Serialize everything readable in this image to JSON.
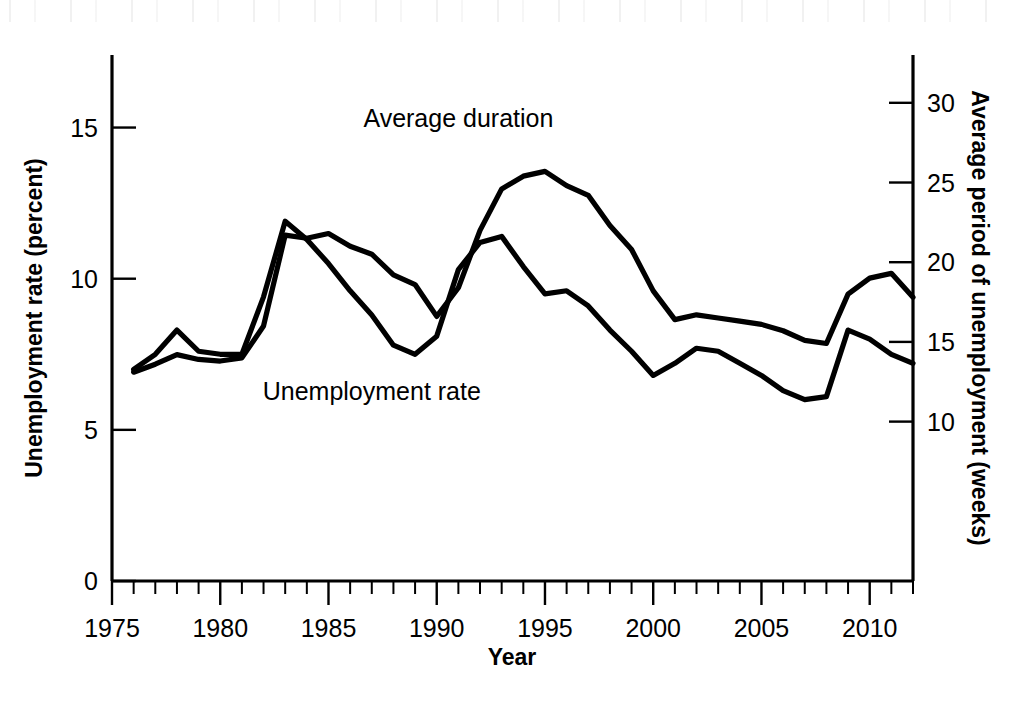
{
  "figure": {
    "background_color": "#ffffff",
    "line_color": "#000000"
  },
  "chart_data": {
    "type": "line",
    "title": "",
    "xlabel": "Year",
    "ylabel": "Unemployment rate (percent)",
    "y2label": "Average period of unemployment (weeks)",
    "xlim": [
      1975,
      2012
    ],
    "ylim": [
      0,
      17.4
    ],
    "y2lim": [
      0,
      33.0
    ],
    "grid": false,
    "legend": "inline-annotations",
    "x_ticks_major": [
      1975,
      1980,
      1985,
      1990,
      1995,
      2000,
      2005,
      2010
    ],
    "x_tick_labels": [
      "1975",
      "1980",
      "1985",
      "1990",
      "1995",
      "2000",
      "2005",
      "2010"
    ],
    "x_ticks_minor_step": 1,
    "y_ticks": [
      0,
      5,
      10,
      15
    ],
    "y_tick_labels": [
      "0",
      "5",
      "10",
      "15"
    ],
    "y2_ticks": [
      10,
      15,
      20,
      25,
      30
    ],
    "y2_tick_labels": [
      "10",
      "15",
      "20",
      "25",
      "30"
    ],
    "x": [
      1976,
      1977,
      1978,
      1979,
      1980,
      1981,
      1982,
      1983,
      1984,
      1985,
      1986,
      1987,
      1988,
      1989,
      1990,
      1991,
      1992,
      1993,
      1994,
      1995,
      1996,
      1997,
      1998,
      1999,
      2000,
      2001,
      2002,
      2003,
      2004,
      2005,
      2006,
      2007,
      2008,
      2009,
      2010,
      2011,
      2012
    ],
    "series": [
      {
        "name": "Average duration",
        "axis": "right",
        "units": "weeks",
        "label_x": 1991,
        "label_y": 28.5,
        "values": [
          13.1,
          13.6,
          14.2,
          13.9,
          13.8,
          14.0,
          16.0,
          21.7,
          21.5,
          21.8,
          21.0,
          20.5,
          19.2,
          18.6,
          16.6,
          18.4,
          22.0,
          24.6,
          25.4,
          25.7,
          24.8,
          24.2,
          22.3,
          20.8,
          18.2,
          16.4,
          16.7,
          16.5,
          16.3,
          16.1,
          15.7,
          15.1,
          14.9,
          18.0,
          19.0,
          19.3,
          17.8
        ]
      },
      {
        "name": "Unemployment rate",
        "axis": "left",
        "units": "percent",
        "label_x": 1987,
        "label_y": 6.0,
        "values": [
          7.0,
          7.5,
          8.3,
          7.6,
          7.5,
          7.5,
          9.4,
          11.9,
          11.3,
          10.5,
          9.6,
          8.8,
          7.8,
          7.5,
          8.1,
          10.3,
          11.2,
          11.4,
          10.4,
          9.5,
          9.6,
          9.1,
          8.3,
          7.6,
          6.8,
          7.2,
          7.7,
          7.6,
          7.2,
          6.8,
          6.3,
          6.0,
          6.1,
          8.3,
          8.0,
          7.5,
          7.2
        ]
      }
    ]
  }
}
